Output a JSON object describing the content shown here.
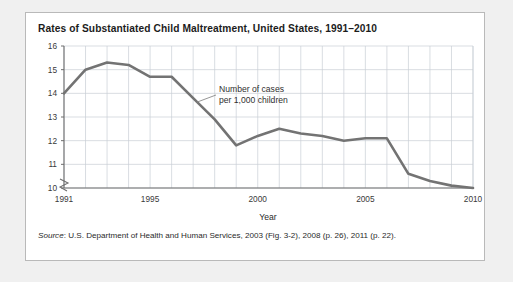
{
  "figure": {
    "title": "Rates of Substantiated Child Maltreatment, United States, 1991–2010",
    "source_label": "Source",
    "source_rest": ": U.S. Department of Health and Human Services, 2003 (Fig. 3-2), 2008 (p. 26), 2011 (p. 22).",
    "source_full": "Source: U.S. Department of Health and Human Services, 2003 (Fig. 3-2), 2008 (p. 26), 2011 (p. 22)."
  },
  "colors": {
    "page_background": "#f0f0f0",
    "card_background": "#ffffff",
    "card_border": "#b9b9b9",
    "grid": "#c9cfd6",
    "axis": "#6e6e6e",
    "series_line": "#737373",
    "title_text": "#1c1c1c",
    "tick_text": "#3a3a3a"
  },
  "chart_data": {
    "type": "line",
    "title": "Rates of Substantiated Child Maltreatment, United States, 1991–2010",
    "xlabel": "Year",
    "ylabel": "",
    "x": [
      1991,
      1992,
      1993,
      1994,
      1995,
      1996,
      1997,
      1998,
      1999,
      2000,
      2001,
      2002,
      2003,
      2004,
      2005,
      2006,
      2007,
      2008,
      2009,
      2010
    ],
    "values": [
      14.0,
      15.0,
      15.3,
      15.2,
      14.7,
      14.7,
      13.8,
      12.9,
      11.8,
      12.2,
      12.5,
      12.3,
      12.2,
      12.0,
      12.1,
      12.1,
      10.6,
      10.3,
      10.1,
      10.0
    ],
    "series": [
      {
        "name": "Number of cases per 1,000 children",
        "values": [
          14.0,
          15.0,
          15.3,
          15.2,
          14.7,
          14.7,
          13.8,
          12.9,
          11.8,
          12.2,
          12.5,
          12.3,
          12.2,
          12.0,
          12.1,
          12.1,
          10.6,
          10.3,
          10.1,
          10.0
        ]
      }
    ],
    "ylim": [
      10,
      16
    ],
    "yticks": [
      10,
      11,
      12,
      13,
      14,
      15,
      16
    ],
    "ytick_labels": [
      "10",
      "11",
      "12",
      "13",
      "14",
      "15",
      "16"
    ],
    "xlim": [
      1991,
      2010
    ],
    "xticks": [
      1991,
      1995,
      2000,
      2005,
      2010
    ],
    "xtick_labels": [
      "1991",
      "1995",
      "2000",
      "2005",
      "2010"
    ],
    "grid": true,
    "legend": "none",
    "y_axis_break": true,
    "annotations": [
      {
        "name": "series-callout",
        "line1": "Number of cases",
        "line2": "per 1,000 children",
        "text": "Number of cases per 1,000 children"
      }
    ]
  }
}
